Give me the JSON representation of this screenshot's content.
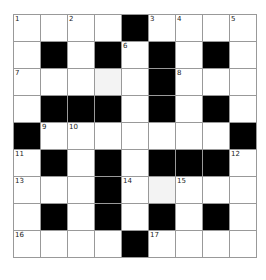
{
  "puzzle": {
    "rows": 9,
    "cols": 9,
    "colors": {
      "block": "#000000",
      "empty": "#ffffff",
      "highlight": "#f3f3f3",
      "gridline": "#999999"
    },
    "grid": [
      [
        "1",
        "",
        "2",
        "",
        "#",
        "3",
        "4",
        "",
        "5"
      ],
      [
        "",
        "#",
        "",
        "#",
        "6",
        "#",
        "",
        "#",
        ""
      ],
      [
        "7",
        "",
        "",
        "",
        "",
        "#",
        "8",
        "",
        ""
      ],
      [
        "",
        "#",
        "#",
        "#",
        "",
        "#",
        "",
        "#",
        ""
      ],
      [
        "#",
        "9",
        "10",
        "",
        "",
        "",
        "",
        "",
        "#"
      ],
      [
        "11",
        "#",
        "",
        "#",
        "",
        "#",
        "#",
        "#",
        "12"
      ],
      [
        "13",
        "",
        "",
        "#",
        "14",
        "",
        "15",
        "",
        ""
      ],
      [
        "",
        "#",
        "",
        "#",
        "",
        "#",
        "",
        "#",
        ""
      ],
      [
        "16",
        "",
        "",
        "",
        "#",
        "17",
        "",
        "",
        ""
      ]
    ],
    "highlighted": [
      [
        2,
        3
      ],
      [
        6,
        5
      ]
    ]
  }
}
